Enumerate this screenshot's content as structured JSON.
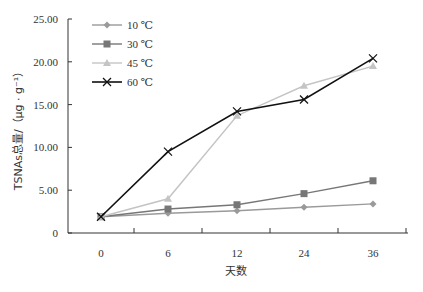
{
  "chart_data": {
    "type": "line",
    "title": "",
    "xlabel": "天数",
    "ylabel": "TSNAs总量/（μg · g⁻¹）",
    "x": [
      0,
      6,
      12,
      24,
      36
    ],
    "x_tick_labels": [
      "0",
      "6",
      "12",
      "24",
      "36"
    ],
    "y_tick_labels": [
      "0",
      "5.00",
      "10.00",
      "15.00",
      "20.00",
      "25.00"
    ],
    "ylim": [
      0,
      25
    ],
    "grid": false,
    "legend_position": "top-left inside",
    "series": [
      {
        "name": "10 ℃",
        "marker": "diamond",
        "color": "#9a9a9a",
        "values": [
          1.9,
          2.3,
          2.6,
          3.0,
          3.4
        ]
      },
      {
        "name": "30 ℃",
        "marker": "square",
        "color": "#777777",
        "values": [
          1.9,
          2.8,
          3.3,
          4.6,
          6.1
        ]
      },
      {
        "name": "45 ℃",
        "marker": "triangle",
        "color": "#c4c4c4",
        "values": [
          1.9,
          4.0,
          13.7,
          17.2,
          19.5
        ]
      },
      {
        "name": "60 ℃",
        "marker": "x",
        "color": "#111111",
        "values": [
          1.9,
          9.5,
          14.2,
          15.6,
          20.4
        ]
      }
    ]
  }
}
